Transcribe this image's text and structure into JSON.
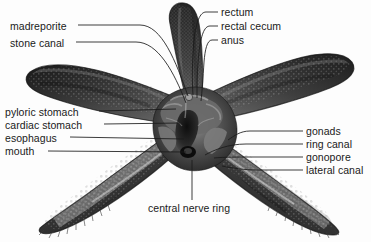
{
  "figure": {
    "background_color": "#fdfdfd",
    "specimen_colors": {
      "body_dark": "#2e2e2e",
      "body_mid": "#4a4a4a",
      "body_light": "#7d7d7d",
      "highlight": "#b9b9b9",
      "cavity_shadow": "#141414"
    },
    "leader_line_color": "#1a1a1a",
    "label_text_color": "#1a1a1a"
  },
  "labels": {
    "left": [
      {
        "id": "madreporite",
        "text": "madreporite",
        "x": 10,
        "y": 28,
        "line_to_x": 188,
        "line_to_y": 96
      },
      {
        "id": "stone-canal",
        "text": "stone canal",
        "x": 10,
        "y": 45,
        "line_to_x": 186,
        "line_to_y": 103
      },
      {
        "id": "pyloric-stomach",
        "text": "pyloric stomach",
        "x": 5,
        "y": 114,
        "line_to_x": 176,
        "line_to_y": 109
      },
      {
        "id": "cardiac-stomach",
        "text": "cardiac stomach",
        "x": 5,
        "y": 127,
        "line_to_x": 180,
        "line_to_y": 124
      },
      {
        "id": "esophagus",
        "text": "esophagus",
        "x": 5,
        "y": 140,
        "line_to_x": 184,
        "line_to_y": 140
      },
      {
        "id": "mouth",
        "text": "mouth",
        "x": 5,
        "y": 154,
        "line_to_x": 186,
        "line_to_y": 152
      }
    ],
    "top": [
      {
        "id": "rectum",
        "text": "rectum",
        "x": 221,
        "y": 8,
        "line_to_x": 193,
        "line_to_y": 95
      },
      {
        "id": "rectal-cecum",
        "text": "rectal cecum",
        "x": 221,
        "y": 22,
        "line_to_x": 197,
        "line_to_y": 98
      },
      {
        "id": "anus",
        "text": "anus",
        "x": 221,
        "y": 36,
        "line_to_x": 201,
        "line_to_y": 101
      }
    ],
    "right": [
      {
        "id": "gonads",
        "text": "gonads",
        "x": 306,
        "y": 128,
        "line_to_x": 228,
        "line_to_y": 140
      },
      {
        "id": "ring-canal",
        "text": "ring canal",
        "x": 306,
        "y": 141,
        "line_to_x": 205,
        "line_to_y": 155
      },
      {
        "id": "gonopore",
        "text": "gonopore",
        "x": 306,
        "y": 154,
        "line_to_x": 214,
        "line_to_y": 158
      },
      {
        "id": "lateral-canal",
        "text": "lateral canal",
        "x": 306,
        "y": 167,
        "line_to_x": 222,
        "line_to_y": 166
      }
    ],
    "bottom": [
      {
        "id": "central-nerve-ring",
        "text": "central nerve ring",
        "x": 148,
        "y": 209,
        "line_to_x": 192,
        "line_to_y": 160
      }
    ]
  },
  "caption": {
    "text": ""
  }
}
